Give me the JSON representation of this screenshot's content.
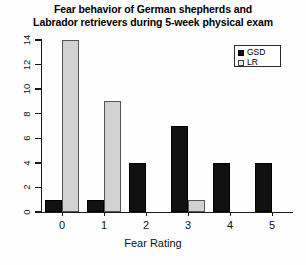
{
  "chart_data": {
    "type": "bar",
    "title": "Fear behavior of German shepherds and Labrador retrievers during 5-week physical exam",
    "title_lines": [
      "Fear behavior of German shepherds and",
      "Labrador retrievers during 5-week physical exam"
    ],
    "xlabel": "Fear Rating",
    "ylabel": "",
    "categories": [
      "0",
      "1",
      "2",
      "3",
      "4",
      "5"
    ],
    "series": [
      {
        "name": "GSD",
        "values": [
          1,
          1,
          4,
          7,
          4,
          4
        ],
        "color": "#111111"
      },
      {
        "name": "LR",
        "values": [
          14,
          9,
          0,
          1,
          0,
          0
        ],
        "color": "#d2d2d2"
      }
    ],
    "ylim": [
      0,
      14
    ],
    "yticks": [
      0,
      2,
      4,
      6,
      8,
      10,
      12,
      14
    ],
    "ytick_labels": [
      "0",
      "2",
      "4",
      "6",
      "8",
      "10",
      "12",
      "14"
    ],
    "grid": false,
    "legend_position": "top-right",
    "legend_entries": [
      "GSD",
      "LR"
    ]
  },
  "legend": {
    "items": [
      {
        "label": "GSD"
      },
      {
        "label": "LR"
      }
    ]
  },
  "axes": {
    "x_title": "Fear Rating"
  }
}
